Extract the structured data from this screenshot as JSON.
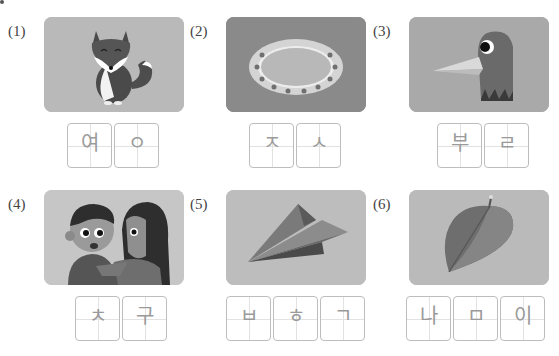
{
  "items": [
    {
      "number": "(1)",
      "picture": "fox",
      "bg": "#b9b9b9",
      "syllables": [
        "여",
        "ㅇ"
      ]
    },
    {
      "number": "(2)",
      "picture": "oval-mirror",
      "bg": "#8a8a8a",
      "syllables": [
        "ㅈ",
        "ㅅ"
      ]
    },
    {
      "number": "(3)",
      "picture": "bird-head",
      "bg": "#a9a9a9",
      "syllables": [
        "부",
        "ㄹ"
      ]
    },
    {
      "number": "(4)",
      "picture": "two-children-friends",
      "bg": "#c6c6c6",
      "syllables": [
        "ㅊ",
        "구"
      ]
    },
    {
      "number": "(5)",
      "picture": "paper-airplane",
      "bg": "#bdbdbd",
      "syllables": [
        "ㅂ",
        "ㅎ",
        "ㄱ"
      ]
    },
    {
      "number": "(6)",
      "picture": "leaf",
      "bg": "#bababa",
      "syllables": [
        "나",
        "ㅁ",
        "이"
      ]
    }
  ]
}
